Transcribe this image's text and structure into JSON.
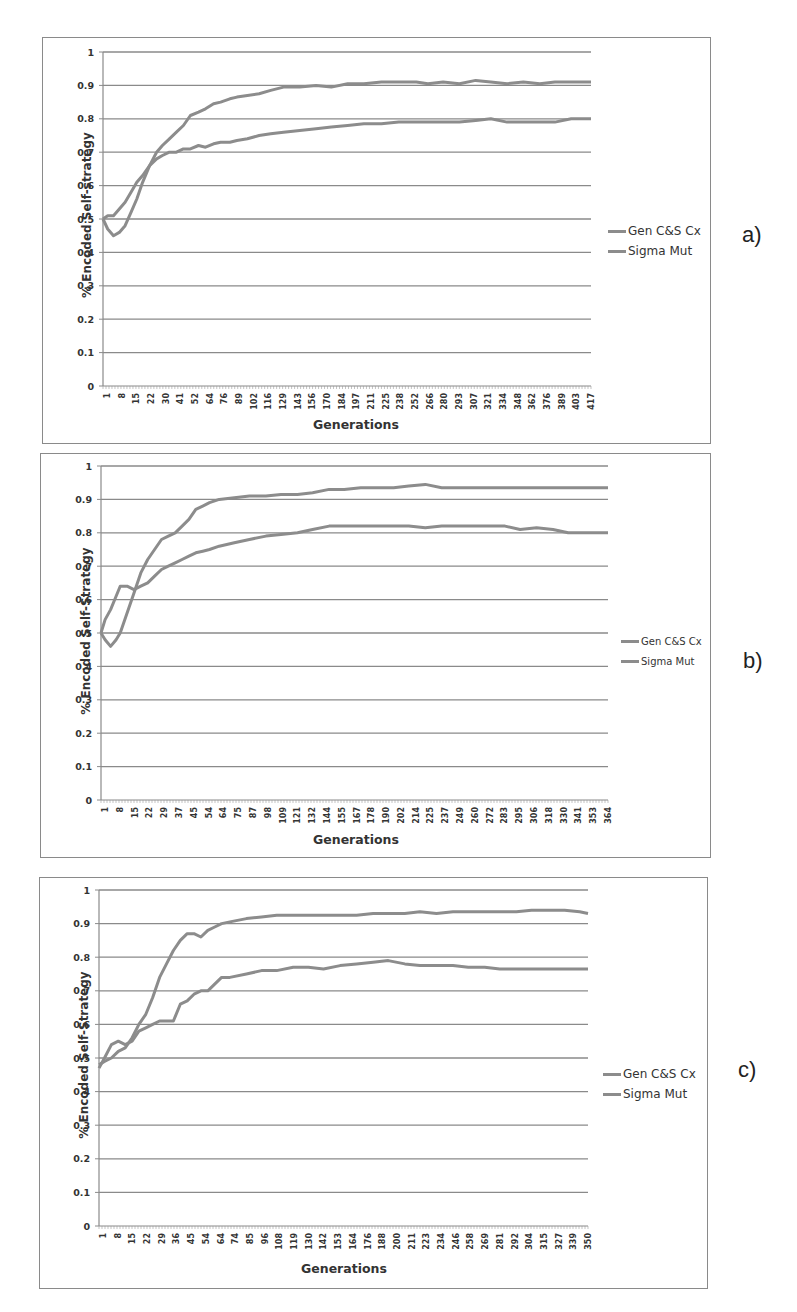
{
  "chart_data": [
    {
      "id": "a",
      "type": "line",
      "panel_label": "a)",
      "xlabel": "Generations",
      "ylabel": "% Encoded Self-strategy",
      "ylim": [
        0,
        1
      ],
      "yticks": [
        "0",
        "0.1",
        "0.2",
        "0.3",
        "0.4",
        "0.5",
        "0.6",
        "0.7",
        "0.8",
        "0.9",
        "1"
      ],
      "xticks": [
        "1",
        "8",
        "15",
        "22",
        "30",
        "41",
        "52",
        "64",
        "76",
        "89",
        "102",
        "116",
        "129",
        "143",
        "156",
        "170",
        "184",
        "197",
        "211",
        "225",
        "238",
        "252",
        "266",
        "280",
        "293",
        "307",
        "321",
        "334",
        "348",
        "362",
        "376",
        "389",
        "403",
        "417"
      ],
      "x_max": 420,
      "grid": true,
      "legend": [
        "Gen C&S Cx",
        "Sigma Mut"
      ],
      "legend_position": "right",
      "series": [
        {
          "name": "Gen C&S Cx",
          "x": [
            1,
            5,
            10,
            15,
            20,
            25,
            30,
            35,
            41,
            47,
            52,
            58,
            64,
            70,
            76,
            83,
            89,
            96,
            102,
            110,
            116,
            125,
            135,
            145,
            156,
            170,
            184,
            197,
            211,
            225,
            240,
            255,
            270,
            280,
            293,
            307,
            321,
            334,
            348,
            362,
            376,
            389,
            403,
            420
          ],
          "y": [
            0.5,
            0.47,
            0.45,
            0.46,
            0.48,
            0.52,
            0.56,
            0.61,
            0.66,
            0.7,
            0.72,
            0.74,
            0.76,
            0.78,
            0.81,
            0.82,
            0.83,
            0.845,
            0.85,
            0.86,
            0.865,
            0.87,
            0.875,
            0.885,
            0.895,
            0.895,
            0.9,
            0.895,
            0.905,
            0.905,
            0.91,
            0.91,
            0.91,
            0.905,
            0.91,
            0.905,
            0.915,
            0.91,
            0.905,
            0.91,
            0.905,
            0.91,
            0.91,
            0.91
          ]
        },
        {
          "name": "Sigma Mut",
          "x": [
            1,
            5,
            10,
            15,
            20,
            25,
            30,
            35,
            41,
            47,
            52,
            58,
            64,
            70,
            76,
            83,
            89,
            96,
            102,
            110,
            116,
            125,
            135,
            145,
            156,
            170,
            184,
            197,
            211,
            225,
            240,
            255,
            270,
            280,
            293,
            307,
            321,
            334,
            348,
            362,
            376,
            389,
            403,
            420
          ],
          "y": [
            0.5,
            0.51,
            0.51,
            0.53,
            0.55,
            0.58,
            0.61,
            0.63,
            0.66,
            0.68,
            0.69,
            0.7,
            0.7,
            0.71,
            0.71,
            0.72,
            0.715,
            0.725,
            0.73,
            0.73,
            0.735,
            0.74,
            0.75,
            0.755,
            0.76,
            0.765,
            0.77,
            0.775,
            0.78,
            0.785,
            0.785,
            0.79,
            0.79,
            0.79,
            0.79,
            0.79,
            0.795,
            0.8,
            0.79,
            0.79,
            0.79,
            0.79,
            0.8,
            0.8
          ]
        }
      ]
    },
    {
      "id": "b",
      "type": "line",
      "panel_label": "b)",
      "xlabel": "Generations",
      "ylabel": "% Encoded Self-Strategy",
      "ylim": [
        0,
        1
      ],
      "yticks": [
        "0",
        "0.1",
        "0.2",
        "0.3",
        "0.4",
        "0.5",
        "0.6",
        "0.7",
        "0.8",
        "0.9",
        "1"
      ],
      "xticks": [
        "1",
        "8",
        "15",
        "22",
        "29",
        "37",
        "45",
        "54",
        "64",
        "75",
        "87",
        "98",
        "109",
        "121",
        "132",
        "144",
        "155",
        "167",
        "178",
        "190",
        "202",
        "214",
        "225",
        "237",
        "249",
        "260",
        "272",
        "283",
        "295",
        "306",
        "318",
        "330",
        "341",
        "353",
        "364"
      ],
      "x_max": 370,
      "grid": true,
      "legend": [
        "Gen C&S Cx",
        "Sigma Mut"
      ],
      "legend_position": "right",
      "series": [
        {
          "name": "Gen C&S Cx",
          "x": [
            1,
            4,
            8,
            12,
            15,
            20,
            25,
            30,
            35,
            40,
            45,
            50,
            55,
            60,
            65,
            70,
            75,
            80,
            87,
            98,
            109,
            121,
            132,
            144,
            155,
            167,
            178,
            190,
            202,
            214,
            225,
            237,
            249,
            260,
            272,
            283,
            295,
            306,
            318,
            330,
            341,
            353,
            370
          ],
          "y": [
            0.5,
            0.48,
            0.46,
            0.48,
            0.5,
            0.56,
            0.62,
            0.68,
            0.72,
            0.75,
            0.78,
            0.79,
            0.8,
            0.82,
            0.84,
            0.87,
            0.88,
            0.89,
            0.9,
            0.905,
            0.91,
            0.91,
            0.915,
            0.915,
            0.92,
            0.93,
            0.93,
            0.935,
            0.935,
            0.935,
            0.94,
            0.945,
            0.935,
            0.935,
            0.935,
            0.935,
            0.935,
            0.935,
            0.935,
            0.935,
            0.935,
            0.935,
            0.935
          ]
        },
        {
          "name": "Sigma Mut",
          "x": [
            1,
            4,
            8,
            12,
            15,
            20,
            25,
            30,
            35,
            40,
            45,
            50,
            55,
            60,
            65,
            70,
            75,
            80,
            87,
            98,
            109,
            121,
            132,
            144,
            155,
            167,
            178,
            190,
            202,
            214,
            225,
            237,
            249,
            260,
            272,
            283,
            295,
            306,
            318,
            330,
            341,
            353,
            370
          ],
          "y": [
            0.5,
            0.54,
            0.57,
            0.61,
            0.64,
            0.64,
            0.63,
            0.64,
            0.65,
            0.67,
            0.69,
            0.7,
            0.71,
            0.72,
            0.73,
            0.74,
            0.745,
            0.75,
            0.76,
            0.77,
            0.78,
            0.79,
            0.795,
            0.8,
            0.81,
            0.82,
            0.82,
            0.82,
            0.82,
            0.82,
            0.82,
            0.815,
            0.82,
            0.82,
            0.82,
            0.82,
            0.82,
            0.81,
            0.815,
            0.81,
            0.8,
            0.8,
            0.8
          ]
        }
      ]
    },
    {
      "id": "c",
      "type": "line",
      "panel_label": "c)",
      "xlabel": "Generations",
      "ylabel": "% Encoded Self-Strategy",
      "ylim": [
        0,
        1
      ],
      "yticks": [
        "0",
        "0.1",
        "0.2",
        "0.3",
        "0.4",
        "0.5",
        "0.6",
        "0.7",
        "0.8",
        "0.9",
        "1"
      ],
      "xticks": [
        "1",
        "8",
        "15",
        "22",
        "29",
        "36",
        "45",
        "54",
        "64",
        "74",
        "85",
        "96",
        "108",
        "119",
        "130",
        "142",
        "153",
        "164",
        "176",
        "188",
        "200",
        "211",
        "223",
        "234",
        "246",
        "258",
        "269",
        "281",
        "292",
        "304",
        "315",
        "327",
        "339",
        "350"
      ],
      "x_max": 356,
      "grid": true,
      "legend": [
        "Gen C&S Cx",
        "Sigma Mut"
      ],
      "legend_position": "right",
      "series": [
        {
          "name": "Gen C&S Cx",
          "x": [
            1,
            5,
            10,
            15,
            20,
            25,
            30,
            35,
            40,
            45,
            50,
            55,
            60,
            65,
            70,
            75,
            80,
            85,
            90,
            96,
            108,
            119,
            130,
            142,
            153,
            164,
            176,
            188,
            200,
            211,
            223,
            234,
            246,
            258,
            269,
            281,
            292,
            304,
            315,
            327,
            339,
            350,
            356
          ],
          "y": [
            0.48,
            0.49,
            0.5,
            0.52,
            0.53,
            0.56,
            0.6,
            0.63,
            0.68,
            0.74,
            0.78,
            0.82,
            0.85,
            0.87,
            0.87,
            0.86,
            0.88,
            0.89,
            0.9,
            0.905,
            0.915,
            0.92,
            0.925,
            0.925,
            0.925,
            0.925,
            0.925,
            0.925,
            0.93,
            0.93,
            0.93,
            0.935,
            0.93,
            0.935,
            0.935,
            0.935,
            0.935,
            0.935,
            0.94,
            0.94,
            0.94,
            0.935,
            0.93
          ]
        },
        {
          "name": "Sigma Mut",
          "x": [
            1,
            5,
            10,
            15,
            20,
            25,
            30,
            35,
            40,
            45,
            50,
            55,
            60,
            65,
            70,
            75,
            80,
            85,
            90,
            96,
            108,
            119,
            130,
            142,
            153,
            164,
            176,
            188,
            200,
            211,
            223,
            234,
            246,
            258,
            269,
            281,
            292,
            304,
            315,
            327,
            339,
            350,
            356
          ],
          "y": [
            0.47,
            0.5,
            0.54,
            0.55,
            0.54,
            0.55,
            0.58,
            0.59,
            0.6,
            0.61,
            0.61,
            0.61,
            0.66,
            0.67,
            0.69,
            0.7,
            0.7,
            0.72,
            0.74,
            0.74,
            0.75,
            0.76,
            0.76,
            0.77,
            0.77,
            0.765,
            0.775,
            0.78,
            0.785,
            0.79,
            0.78,
            0.775,
            0.775,
            0.775,
            0.77,
            0.77,
            0.765,
            0.765,
            0.765,
            0.765,
            0.765,
            0.765,
            0.765
          ]
        }
      ]
    }
  ]
}
